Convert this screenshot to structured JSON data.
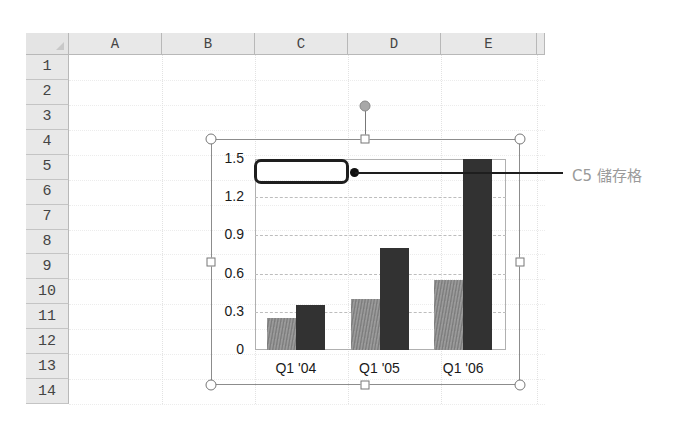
{
  "spreadsheet": {
    "columns": [
      {
        "label": "A",
        "left": 69,
        "width": 93
      },
      {
        "label": "B",
        "left": 162,
        "width": 93
      },
      {
        "label": "C",
        "left": 255,
        "width": 93
      },
      {
        "label": "D",
        "left": 348,
        "width": 93
      },
      {
        "label": "E",
        "left": 441,
        "width": 96
      }
    ],
    "rows": [
      "1",
      "2",
      "3",
      "4",
      "5",
      "6",
      "7",
      "8",
      "9",
      "10",
      "11",
      "12",
      "13",
      "14"
    ]
  },
  "callout": {
    "label": "C5 儲存格"
  },
  "chart_data": {
    "type": "bar",
    "title": "",
    "xlabel": "",
    "ylabel": "",
    "categories": [
      "Q1 '04",
      "Q1 '05",
      "Q1 '06"
    ],
    "series": [
      {
        "name": "Series 1",
        "color": "#8a8a8a",
        "values": [
          0.25,
          0.4,
          0.55
        ]
      },
      {
        "name": "Series 2",
        "color": "#323232",
        "values": [
          0.35,
          0.8,
          1.5
        ]
      }
    ],
    "ylim": [
      0,
      1.5
    ],
    "yticks": [
      "0",
      "0.3",
      "0.6",
      "0.9",
      "1.2",
      "1.5"
    ],
    "grid": true,
    "legend": "none"
  }
}
